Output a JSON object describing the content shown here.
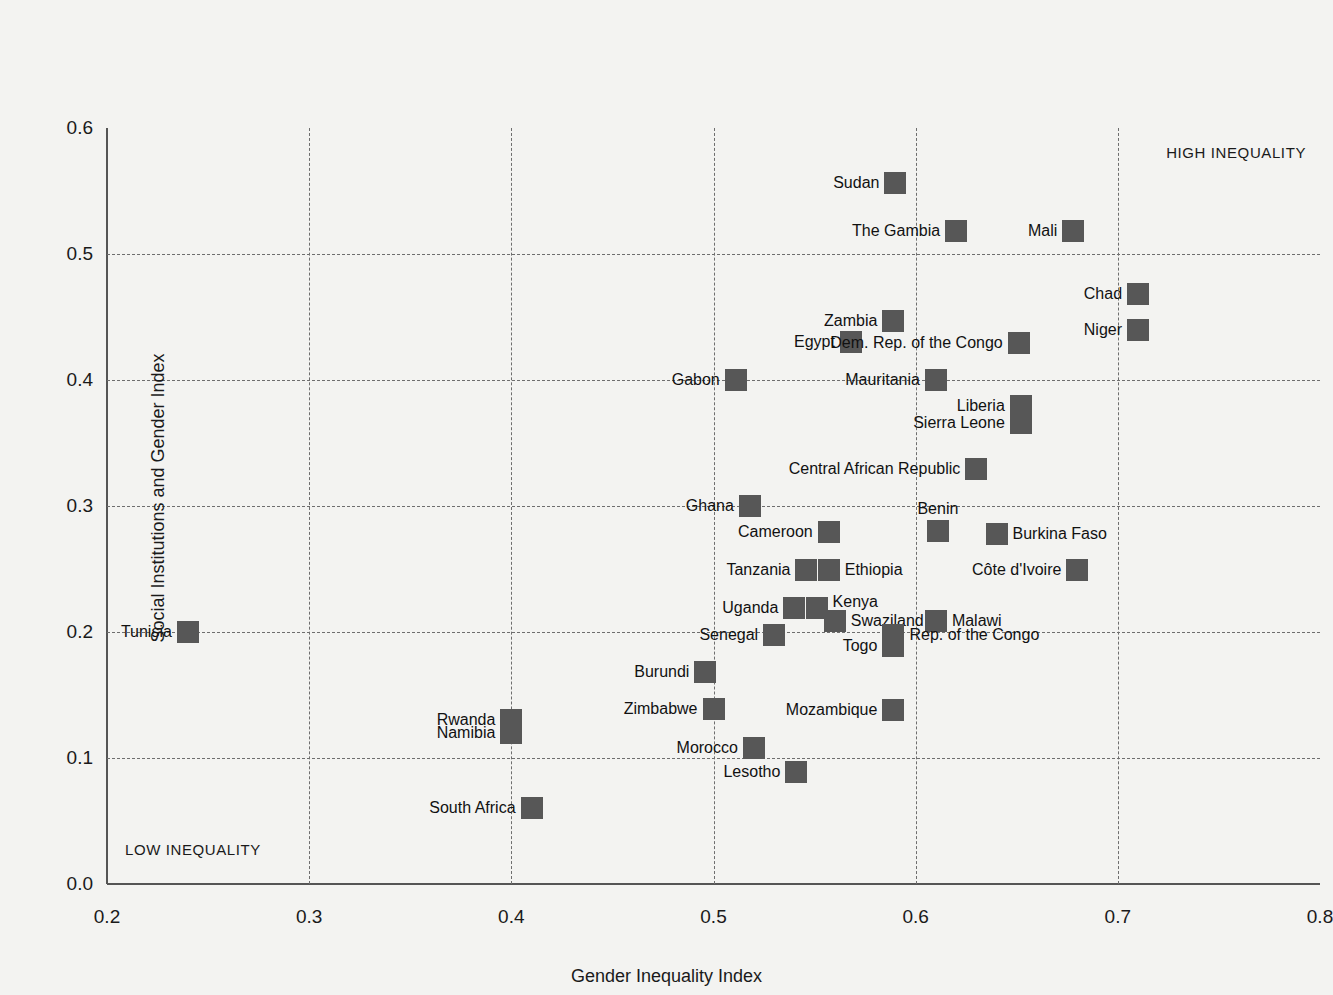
{
  "chart_data": {
    "type": "scatter",
    "title": "",
    "xlabel": "Gender Inequality Index",
    "ylabel": "Social Institutions and Gender Index",
    "xlim": [
      0.2,
      0.8
    ],
    "ylim": [
      0.0,
      0.6
    ],
    "xticks": [
      "0.2",
      "0.3",
      "0.4",
      "0.5",
      "0.6",
      "0.7",
      "0.8"
    ],
    "yticks": [
      "0.0",
      "0.1",
      "0.2",
      "0.3",
      "0.4",
      "0.5",
      "0.6"
    ],
    "xtick_values": [
      0.2,
      0.3,
      0.4,
      0.5,
      0.6,
      0.7,
      0.8
    ],
    "ytick_values": [
      0.0,
      0.1,
      0.2,
      0.3,
      0.4,
      0.5,
      0.6
    ],
    "grid": true,
    "legend": "none",
    "marker_color": "#575757",
    "grid_color": "#6e6e6e",
    "axis_color": "#555555",
    "background_color": "#f3f3f1",
    "annotations": [
      {
        "text": "HIGH INEQUALITY",
        "position": "top-right"
      },
      {
        "text": "LOW INEQUALITY",
        "position": "bottom-left"
      }
    ],
    "points": [
      {
        "label": "Sudan",
        "x": 0.59,
        "y": 0.556,
        "lpos": "lbl-left"
      },
      {
        "label": "The Gambia",
        "x": 0.62,
        "y": 0.518,
        "lpos": "lbl-left"
      },
      {
        "label": "Mali",
        "x": 0.678,
        "y": 0.518,
        "lpos": "lbl-left"
      },
      {
        "label": "Chad",
        "x": 0.71,
        "y": 0.468,
        "lpos": "lbl-left"
      },
      {
        "label": "Zambia",
        "x": 0.589,
        "y": 0.447,
        "lpos": "lbl-left"
      },
      {
        "label": "Niger",
        "x": 0.71,
        "y": 0.44,
        "lpos": "lbl-left"
      },
      {
        "label": "Egypt",
        "x": 0.568,
        "y": 0.43,
        "lpos": "lbl-left"
      },
      {
        "label": "Dem. Rep. of the Congo",
        "x": 0.651,
        "y": 0.429,
        "lpos": "lbl-left"
      },
      {
        "label": "Gabon",
        "x": 0.511,
        "y": 0.4,
        "lpos": "lbl-left"
      },
      {
        "label": "Mauritania",
        "x": 0.61,
        "y": 0.4,
        "lpos": "lbl-left"
      },
      {
        "label": "Liberia",
        "x": 0.652,
        "y": 0.379,
        "lpos": "lbl-left"
      },
      {
        "label": "Sierra Leone",
        "x": 0.652,
        "y": 0.366,
        "lpos": "lbl-left"
      },
      {
        "label": "Central African Republic",
        "x": 0.63,
        "y": 0.329,
        "lpos": "lbl-left"
      },
      {
        "label": "Ghana",
        "x": 0.518,
        "y": 0.3,
        "lpos": "lbl-left"
      },
      {
        "label": "Benin",
        "x": 0.611,
        "y": 0.28,
        "lpos": "lbl-above"
      },
      {
        "label": "Cameroon",
        "x": 0.557,
        "y": 0.279,
        "lpos": "lbl-left"
      },
      {
        "label": "Burkina Faso",
        "x": 0.64,
        "y": 0.278,
        "lpos": "lbl-right"
      },
      {
        "label": "Tanzania",
        "x": 0.546,
        "y": 0.249,
        "lpos": "lbl-left"
      },
      {
        "label": "Ethiopia",
        "x": 0.557,
        "y": 0.249,
        "lpos": "lbl-right"
      },
      {
        "label": "Côte d'Ivoire",
        "x": 0.68,
        "y": 0.249,
        "lpos": "lbl-left"
      },
      {
        "label": "Kenya",
        "x": 0.551,
        "y": 0.219,
        "lpos": "lbl-above-right"
      },
      {
        "label": "Uganda",
        "x": 0.54,
        "y": 0.219,
        "lpos": "lbl-left"
      },
      {
        "label": "Swaziland",
        "x": 0.56,
        "y": 0.209,
        "lpos": "lbl-right"
      },
      {
        "label": "Malawi",
        "x": 0.61,
        "y": 0.209,
        "lpos": "lbl-right"
      },
      {
        "label": "Tunisia",
        "x": 0.24,
        "y": 0.2,
        "lpos": "lbl-left"
      },
      {
        "label": "Senegal",
        "x": 0.53,
        "y": 0.198,
        "lpos": "lbl-left"
      },
      {
        "label": "Rep. of the Congo",
        "x": 0.589,
        "y": 0.198,
        "lpos": "lbl-right"
      },
      {
        "label": "Togo",
        "x": 0.589,
        "y": 0.189,
        "lpos": "lbl-left"
      },
      {
        "label": "Burundi",
        "x": 0.496,
        "y": 0.168,
        "lpos": "lbl-left"
      },
      {
        "label": "Zimbabwe",
        "x": 0.5,
        "y": 0.139,
        "lpos": "lbl-left"
      },
      {
        "label": "Mozambique",
        "x": 0.589,
        "y": 0.138,
        "lpos": "lbl-left"
      },
      {
        "label": "Rwanda",
        "x": 0.4,
        "y": 0.13,
        "lpos": "lbl-left"
      },
      {
        "label": "Namibia",
        "x": 0.4,
        "y": 0.12,
        "lpos": "lbl-left"
      },
      {
        "label": "Morocco",
        "x": 0.52,
        "y": 0.108,
        "lpos": "lbl-left"
      },
      {
        "label": "Lesotho",
        "x": 0.541,
        "y": 0.089,
        "lpos": "lbl-left"
      },
      {
        "label": "South Africa",
        "x": 0.41,
        "y": 0.06,
        "lpos": "lbl-left"
      }
    ]
  }
}
